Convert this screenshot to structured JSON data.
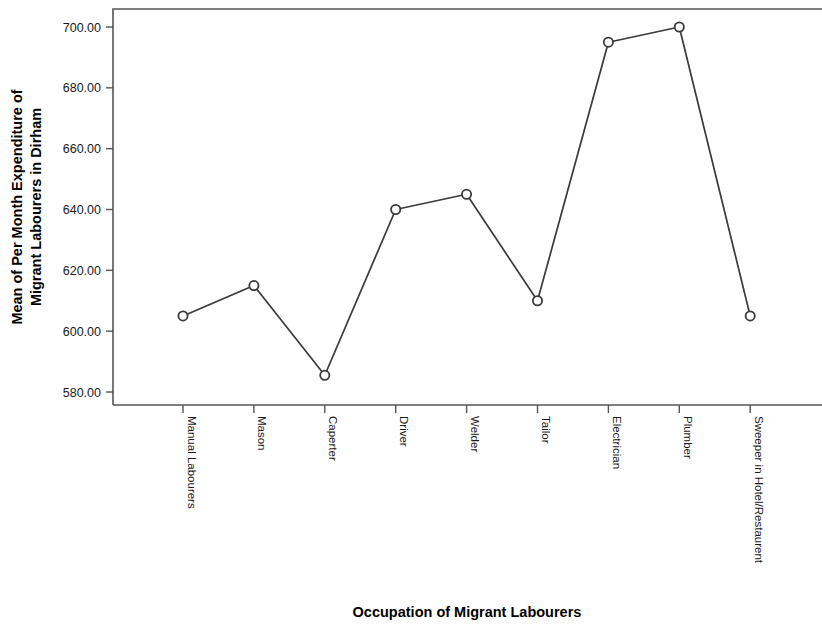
{
  "chart_data": {
    "type": "line",
    "title": "",
    "xlabel": "Occupation of Migrant Labourers",
    "ylabel": "Mean of Per Month Expenditure of Migrant Labourers in Dirham",
    "ylabel_line1": "Mean of Per Month Expenditure of",
    "ylabel_line2": "Migrant Labourers in Dirham",
    "categories": [
      "Manual Labourers",
      "Mason",
      "Caperter",
      "Driver",
      "Welder",
      "Tailor",
      "Electrician",
      "Plumber",
      "Sweeper in Hotel/Restaurent"
    ],
    "values": [
      605,
      615,
      585.5,
      640,
      645,
      610,
      695,
      700,
      605
    ],
    "ytick_labels": [
      "580.00",
      "600.00",
      "620.00",
      "640.00",
      "660.00",
      "680.00",
      "700.00"
    ],
    "ytick_values": [
      580,
      600,
      620,
      640,
      660,
      680,
      700
    ],
    "ylim": [
      575,
      705
    ],
    "grid": false,
    "legend": false,
    "marker": "open-circle",
    "line_color": "#3a3a3a",
    "marker_fill": "#ffffff",
    "axis_color": "#555555",
    "background": "#ffffff"
  }
}
